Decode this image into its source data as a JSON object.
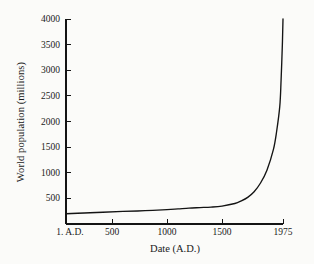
{
  "chart_data": {
    "type": "line",
    "title": "",
    "xlabel": "Date (A.D.)",
    "ylabel": "World population (millions)",
    "xlim": [
      1,
      1975
    ],
    "ylim": [
      0,
      4000
    ],
    "grid": false,
    "legend": "none",
    "line_color": "#141414",
    "background_color": "#fbfbf9",
    "xtick_labels": [
      "1. A.D.",
      "500",
      "1000",
      "1500",
      "1975"
    ],
    "xtick_values": [
      1,
      500,
      1000,
      1500,
      1975
    ],
    "ytick_labels": [
      "500",
      "1000",
      "1500",
      "2000",
      "2500",
      "3000",
      "3500",
      "4000"
    ],
    "ytick_values": [
      500,
      1000,
      1500,
      2000,
      2500,
      3000,
      3500,
      4000
    ],
    "series": [
      {
        "name": "World population",
        "x": [
          1,
          200,
          400,
          600,
          800,
          1000,
          1100,
          1200,
          1300,
          1400,
          1500,
          1600,
          1650,
          1700,
          1750,
          1800,
          1850,
          1900,
          1925,
          1950,
          1960,
          1970,
          1975
        ],
        "values": [
          200,
          215,
          230,
          245,
          260,
          280,
          295,
          310,
          320,
          330,
          350,
          400,
          450,
          520,
          630,
          800,
          1050,
          1450,
          1800,
          2300,
          2800,
          3500,
          4000
        ]
      }
    ]
  },
  "axis": {
    "spines": "left-bottom",
    "tick_direction": "in"
  }
}
